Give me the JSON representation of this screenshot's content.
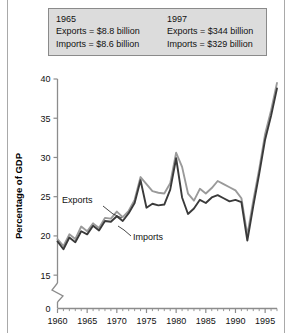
{
  "callout": {
    "left": {
      "year": "1965",
      "exports": "Exports = $8.8 billion",
      "imports": "Imports = $8.6 billion"
    },
    "right": {
      "year": "1997",
      "exports": "Exports = $344 billion",
      "imports": "Imports = $329 billion"
    }
  },
  "labels": {
    "exports": "Exports",
    "imports": "Imports",
    "ylabel": "Percentage of GDP"
  },
  "axis": {
    "y_ticks": [
      "0",
      "15",
      "20",
      "25",
      "30",
      "35",
      "40"
    ],
    "x_ticks": [
      "1960",
      "1965",
      "1970",
      "1975",
      "1980",
      "1985",
      "1990",
      "1995"
    ]
  },
  "colors": {
    "exports_line": "#9a9a9a",
    "imports_line": "#3a3a3a",
    "callout_bg": "#dcdcdc",
    "callout_border": "#8a8a8a",
    "axis": "#8c8c8c",
    "rule": "#a9a9a9"
  },
  "chart_data": {
    "type": "line",
    "title": "",
    "xlabel": "",
    "ylabel": "Percentage of GDP",
    "xlim": [
      1960,
      1997
    ],
    "ylim": [
      14,
      40
    ],
    "y_axis_break": true,
    "y_break_between": [
      0,
      14
    ],
    "grid": false,
    "legend": "inline-annotations",
    "x": [
      1960,
      1961,
      1962,
      1963,
      1964,
      1965,
      1966,
      1967,
      1968,
      1969,
      1970,
      1971,
      1972,
      1973,
      1974,
      1975,
      1976,
      1977,
      1978,
      1979,
      1980,
      1981,
      1982,
      1983,
      1984,
      1985,
      1986,
      1987,
      1988,
      1989,
      1990,
      1991,
      1992,
      1993,
      1994,
      1995,
      1996,
      1997
    ],
    "series": [
      {
        "name": "Exports",
        "color": "#9a9a9a",
        "values": [
          19.6,
          18.7,
          20.2,
          19.6,
          21.2,
          20.6,
          21.6,
          21.0,
          22.3,
          22.2,
          23.1,
          22.4,
          23.2,
          24.6,
          27.5,
          26.6,
          25.7,
          25.5,
          25.4,
          26.7,
          30.6,
          28.8,
          25.4,
          24.5,
          26.0,
          25.4,
          26.1,
          27.0,
          26.6,
          26.2,
          25.8,
          24.8,
          20.1,
          24.5,
          28.5,
          33.0,
          36.0,
          39.5
        ]
      },
      {
        "name": "Imports",
        "color": "#3a3a3a",
        "values": [
          19.3,
          18.3,
          19.8,
          19.2,
          20.6,
          20.2,
          21.3,
          20.7,
          21.9,
          21.8,
          22.5,
          21.9,
          22.9,
          24.2,
          27.1,
          23.6,
          24.1,
          23.9,
          24.0,
          25.9,
          29.9,
          24.9,
          22.8,
          23.5,
          24.6,
          24.2,
          24.9,
          25.2,
          24.8,
          24.4,
          24.6,
          24.3,
          19.4,
          23.8,
          27.9,
          32.3,
          35.3,
          38.8
        ]
      }
    ],
    "annotations": [
      {
        "text": "1965 Exports = $8.8 billion, Imports = $8.6 billion"
      },
      {
        "text": "1997 Exports = $344 billion, Imports = $329 billion"
      }
    ]
  }
}
